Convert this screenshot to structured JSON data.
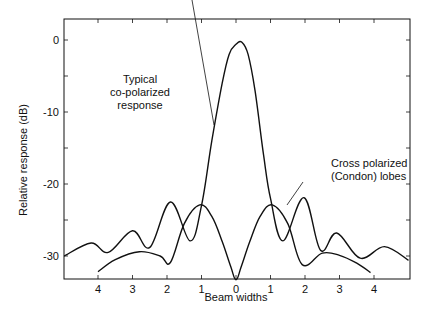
{
  "chart_data": {
    "type": "line",
    "title": "",
    "xlabel": "Beam widths",
    "ylabel": "Relative response (dB)",
    "xlim": [
      -5.0,
      5.0
    ],
    "ylim": [
      -33.5,
      3
    ],
    "x_ticks": [
      -4,
      -3,
      -2,
      -1,
      0,
      1,
      2,
      3,
      4
    ],
    "x_tick_labels": [
      "4",
      "3",
      "2",
      "1",
      "0",
      "1",
      "2",
      "3",
      "4"
    ],
    "y_ticks": [
      0,
      -10,
      -20,
      -30
    ],
    "y_tick_labels": [
      "0",
      "-10",
      "-20",
      "-30"
    ],
    "grid": false,
    "legend": null,
    "series": [
      {
        "name": "Typical co-polarized response",
        "x": [
          -4.98,
          -4.2,
          -3.7,
          -3.0,
          -2.5,
          -1.9,
          -1.33,
          -1.0,
          -0.7,
          -0.4,
          -0.2,
          0.0,
          0.17,
          0.35,
          0.55,
          0.8,
          1.0,
          1.36,
          1.97,
          2.45,
          2.92,
          3.6,
          4.3,
          5.0
        ],
        "y": [
          -30.0,
          -28.2,
          -29.5,
          -26.5,
          -28.8,
          -22.5,
          -27.9,
          -23.0,
          -14.0,
          -6.0,
          -2.0,
          -0.6,
          -0.3,
          -2.0,
          -7.0,
          -16.0,
          -22.0,
          -27.9,
          -21.9,
          -29.2,
          -26.8,
          -30.3,
          -28.7,
          -30.6
        ],
        "annotation": "Typical co-polarized response"
      },
      {
        "name": "Cross polarized (Condon) lobes",
        "x": [
          -4.0,
          -3.5,
          -2.8,
          -2.2,
          -1.9,
          -1.5,
          -1.05,
          -0.7,
          -0.4,
          -0.15,
          0.0,
          0.15,
          0.4,
          0.7,
          1.05,
          1.5,
          1.92,
          2.5,
          3.0,
          3.5,
          3.9
        ],
        "y": [
          -32.2,
          -30.5,
          -29.4,
          -30.0,
          -30.9,
          -25.5,
          -22.9,
          -24.5,
          -28.0,
          -31.5,
          -33.3,
          -31.5,
          -28.0,
          -24.5,
          -22.9,
          -25.5,
          -31.2,
          -29.6,
          -29.9,
          -31.0,
          -32.3
        ],
        "annotation": "Cross polarized (Condon) lobes"
      }
    ],
    "annotations": [
      {
        "text": [
          "Typical",
          "co-polarized",
          "response"
        ],
        "points_to": "co-polarized main lobe, left flank near -15 dB"
      },
      {
        "text": [
          "Cross polarized",
          "(Condon) lobes"
        ],
        "points_to": "right cross-polarized lobe near -25 dB"
      }
    ]
  },
  "axes": {
    "xlabel": "Beam widths",
    "ylabel": "Relative response (dB)"
  },
  "annotations": {
    "copol": [
      "Typical",
      "co-polarized",
      "response"
    ],
    "crosspol": [
      "Cross polarized",
      "(Condon) lobes"
    ]
  }
}
